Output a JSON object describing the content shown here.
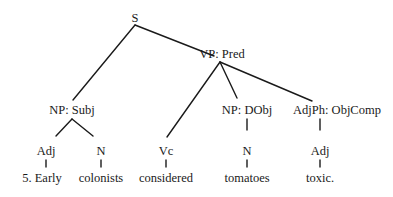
{
  "diagram": {
    "type": "syntax-tree",
    "nodes": {
      "s": "S",
      "vp_pred": "VP: Pred",
      "np_subj": "NP: Subj",
      "adj1": "Adj",
      "n1": "N",
      "vc": "Vc",
      "np_dobj": "NP: DObj",
      "adjph_objcomp": "AdjPh: ObjComp",
      "n2": "N",
      "adj2": "Adj"
    },
    "words": {
      "early": "5. Early",
      "colonists": "colonists",
      "considered": "considered",
      "tomatoes": "tomatoes",
      "toxic": "toxic."
    },
    "edges": [
      [
        "S",
        "NP: Subj"
      ],
      [
        "S",
        "VP: Pred"
      ],
      [
        "NP: Subj",
        "Adj"
      ],
      [
        "NP: Subj",
        "N"
      ],
      [
        "VP: Pred",
        "Vc"
      ],
      [
        "VP: Pred",
        "NP: DObj"
      ],
      [
        "VP: Pred",
        "AdjPh: ObjComp"
      ],
      [
        "NP: DObj",
        "N"
      ],
      [
        "AdjPh: ObjComp",
        "Adj"
      ],
      [
        "Adj",
        "5. Early"
      ],
      [
        "N",
        "colonists"
      ],
      [
        "Vc",
        "considered"
      ],
      [
        "N",
        "tomatoes"
      ],
      [
        "Adj",
        "toxic."
      ]
    ]
  }
}
